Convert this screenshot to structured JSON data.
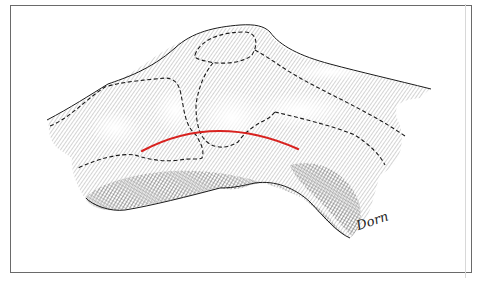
{
  "figure": {
    "signature": "Dorn",
    "colors": {
      "frame": "#6a6a6a",
      "ink": "#1a1a1a",
      "hatch": "#3a3a3a",
      "incision": "#d8221f"
    },
    "incision_line": {
      "start": [
        142,
        150
      ],
      "control": [
        215,
        112
      ],
      "end": [
        298,
        149
      ]
    }
  }
}
